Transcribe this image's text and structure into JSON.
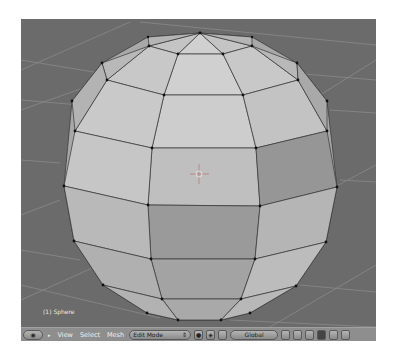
{
  "viewport": {
    "object_label": "(1) Sphere",
    "background": "#6b6b6b",
    "mesh_face_light": "#c9c9c9",
    "mesh_face_mid": "#b0b0b0",
    "mesh_face_dark": "#8f8f8f"
  },
  "header": {
    "menus": [
      "View",
      "Select",
      "Mesh"
    ],
    "mode_selector": "Edit Mode",
    "orientation_selector": "Global"
  }
}
